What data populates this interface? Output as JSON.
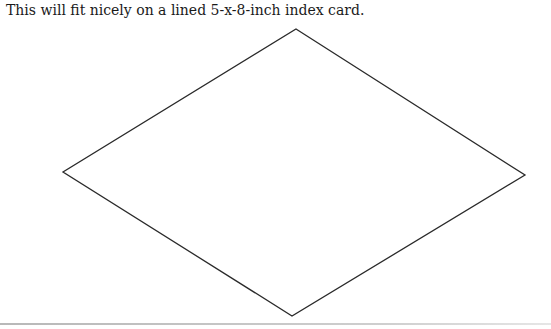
{
  "document": {
    "caption": "This will fit nicely on a lined 5-x-8-inch index card."
  },
  "figure": {
    "shape": "diamond",
    "stroke": "#2a2a2a",
    "vertices": {
      "top": [
        296,
        29
      ],
      "right": [
        525,
        175
      ],
      "bottom": [
        292,
        316
      ],
      "left": [
        63,
        172
      ]
    }
  },
  "rule": {
    "color": "#c0c0c0"
  }
}
